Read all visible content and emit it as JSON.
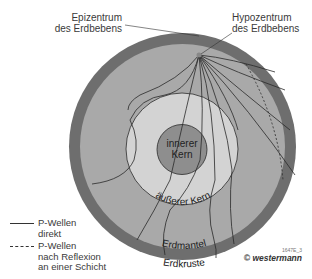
{
  "labels": {
    "epicenter": [
      "Epizentrum",
      "des Erdbebens"
    ],
    "hypocenter": [
      "Hypozentrum",
      "des Erdbebens"
    ],
    "inner_core": [
      "innerer",
      "Kern"
    ],
    "outer_core": "äußerer Kern",
    "mantle": "Erdmantel",
    "crust": "Erdkruste"
  },
  "legend": {
    "direct": [
      "P-Wellen",
      "direkt"
    ],
    "reflected": [
      "P-Wellen",
      "nach Reflexion",
      "an einer Schicht"
    ]
  },
  "credit": {
    "code": "1647E_3",
    "publisher": "© westermann"
  },
  "colors": {
    "crust": "#6e6e6e",
    "mantle": "#a9a9a9",
    "outer_core": "#d3d3d3",
    "inner_core": "#8e8e8e",
    "lines": "#2a2a2a"
  }
}
